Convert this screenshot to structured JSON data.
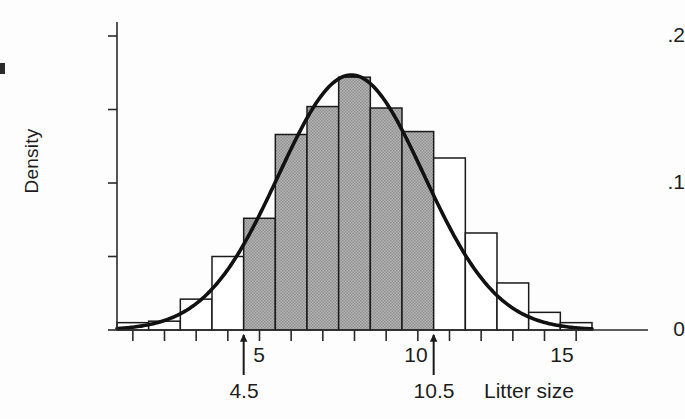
{
  "chart_data": {
    "type": "bar",
    "title": "",
    "subtitle": "",
    "xlabel": "Litter size",
    "ylabel": "Density",
    "xlim": [
      0.5,
      15.5
    ],
    "ylim": [
      0,
      0.2
    ],
    "grid": false,
    "legend": "none",
    "x_tick_labels": [
      "5",
      "10",
      "15"
    ],
    "x_tick_values": [
      5,
      10,
      15
    ],
    "x_minor_tick_values": [
      1,
      2,
      3,
      4,
      6,
      7,
      8,
      9,
      11,
      12,
      13,
      14
    ],
    "y_tick_labels": [
      "0",
      ".1",
      ".2"
    ],
    "y_tick_values": [
      0,
      0.1,
      0.2
    ],
    "y_minor_tick_values": [
      0.05,
      0.15
    ],
    "categories": [
      1,
      2,
      3,
      4,
      5,
      6,
      7,
      8,
      9,
      10,
      11,
      12,
      13,
      14,
      15
    ],
    "values": [
      0.005,
      0.006,
      0.021,
      0.05,
      0.076,
      0.133,
      0.152,
      0.172,
      0.151,
      0.135,
      0.117,
      0.066,
      0.032,
      0.012,
      0.005
    ],
    "bar_fill_unshaded": "#ffffff",
    "bar_fill_shaded": "#a9a9a9",
    "bar_stroke": "#1a1a1a",
    "shaded_range": [
      4.5,
      10.5
    ],
    "shaded_categories": [
      5,
      6,
      7,
      8,
      9,
      10
    ],
    "overlay_curve": {
      "name": "normal density",
      "type": "line",
      "color": "#111111",
      "mean": 7.9,
      "sd": 2.3,
      "peak_value": 0.173
    },
    "annotations": [
      {
        "name": "lower-bound-arrow",
        "x": 4.5,
        "label": "4.5",
        "points_to": "x-axis"
      },
      {
        "name": "upper-bound-arrow",
        "x": 10.5,
        "label": "10.5",
        "points_to": "x-axis"
      }
    ]
  },
  "labels": {
    "y_axis_title": "Density",
    "x_axis_title": "Litter size",
    "y_ticks": [
      "0",
      ".1",
      ".2"
    ],
    "x_ticks": [
      "5",
      "10",
      "15"
    ],
    "arrow_lower": "4.5",
    "arrow_upper": "10.5"
  }
}
